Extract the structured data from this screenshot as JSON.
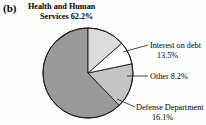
{
  "figure": {
    "panel_label": "(b)",
    "background_color": "#fdfdfd",
    "outline_color": "#1a1a1a"
  },
  "labels": {
    "hhs_line1": "Health and Human",
    "hhs_line2": "Services 62.2%",
    "interest_line1": "Interest on debt",
    "interest_line2": "13.5%",
    "other_line1": "Other 8.2%",
    "defense_line1": "Defense Department",
    "defense_line2": "16.1%"
  },
  "chart_data": {
    "type": "pie",
    "title": "(b)",
    "xlabel": "",
    "ylabel": "",
    "legend_position": "callout-labels",
    "grid": false,
    "units": "percent",
    "total": 100.0,
    "start_angle_deg": 90,
    "direction": "counterclockwise",
    "categories": [
      "Health and Human Services",
      "Defense Department",
      "Other",
      "Interest on debt"
    ],
    "values": [
      62.2,
      16.1,
      8.2,
      13.5
    ],
    "labels": [
      "Health and Human Services 62.2%",
      "Defense Department 16.1%",
      "Other 8.2%",
      "Interest on debt 13.5%"
    ],
    "colors": [
      "#9a9a9a",
      "#c4c4c4",
      "#ffffff",
      "#dcdcdc"
    ],
    "slices": [
      {
        "name": "Health and Human Services",
        "value": 62.2,
        "label": "Health and Human Services 62.2%",
        "color": "#9a9a9a",
        "start_deg": 90,
        "end_deg": 313.92
      },
      {
        "name": "Defense Department",
        "value": 16.1,
        "label": "Defense Department 16.1%",
        "color": "#c4c4c4",
        "start_deg": 313.92,
        "end_deg": 371.88
      },
      {
        "name": "Other",
        "value": 8.2,
        "label": "Other 8.2%",
        "color": "#ffffff",
        "start_deg": 371.88,
        "end_deg": 401.4
      },
      {
        "name": "Interest on debt",
        "value": 13.5,
        "label": "Interest on debt 13.5%",
        "color": "#dcdcdc",
        "start_deg": 401.4,
        "end_deg": 450
      }
    ]
  }
}
